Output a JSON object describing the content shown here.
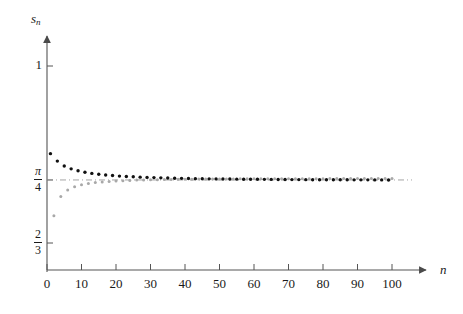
{
  "chart_data": {
    "type": "scatter",
    "title": "",
    "xlabel": "n",
    "ylabel": "s_n",
    "xlim": [
      0,
      110
    ],
    "ylim": [
      0.6,
      1.05
    ],
    "grid": false,
    "legend": "none",
    "x_ticks": [
      0,
      10,
      20,
      30,
      40,
      50,
      60,
      70,
      80,
      90,
      100
    ],
    "x_tick_labels": [
      "0",
      "10",
      "20",
      "30",
      "40",
      "50",
      "60",
      "70",
      "80",
      "90",
      "100"
    ],
    "y_ticks": [
      1,
      0.7853981634,
      0.6666666667
    ],
    "y_tick_labels": [
      "1",
      "π/4",
      "2/3"
    ],
    "y_tick_label_parts": [
      {
        "kind": "plain",
        "text": "1"
      },
      {
        "kind": "fraction",
        "num": "π",
        "num_italic": true,
        "den": "4"
      },
      {
        "kind": "fraction",
        "num": "2",
        "num_italic": false,
        "den": "3"
      }
    ],
    "annotations": [
      {
        "type": "hline",
        "y": 0.7853981634,
        "label": "π/4",
        "style": "dash-dot",
        "color": "#9a9a9a"
      }
    ],
    "series": [
      {
        "name": "odd partial sums",
        "color": "#111111",
        "marker": "filled-circle",
        "marker_size": 3.4,
        "x": [
          1,
          3,
          5,
          7,
          9,
          11,
          13,
          15,
          17,
          19,
          21,
          23,
          25,
          27,
          29,
          31,
          33,
          35,
          37,
          39,
          41,
          43,
          45,
          47,
          49,
          51,
          53,
          55,
          57,
          59,
          61,
          63,
          65,
          67,
          69,
          71,
          73,
          75,
          77,
          79,
          81,
          83,
          85,
          87,
          89,
          91,
          93,
          95,
          97,
          99
        ],
        "y": [
          0.8349,
          0.8209,
          0.8118,
          0.8063,
          0.8026,
          0.7998,
          0.7977,
          0.7961,
          0.7948,
          0.7937,
          0.7927,
          0.792,
          0.7913,
          0.7907,
          0.7902,
          0.7898,
          0.7894,
          0.789,
          0.7887,
          0.7884,
          0.7882,
          0.7879,
          0.7877,
          0.7875,
          0.7874,
          0.7872,
          0.7871,
          0.7869,
          0.7868,
          0.7867,
          0.7866,
          0.7865,
          0.7864,
          0.7863,
          0.7862,
          0.7861,
          0.7861,
          0.786,
          0.7859,
          0.7859,
          0.7858,
          0.7858,
          0.7857,
          0.7857,
          0.7856,
          0.7856,
          0.7856,
          0.7855,
          0.7855,
          0.7854
        ]
      },
      {
        "name": "even partial sums",
        "color": "#a8a8a8",
        "marker": "filled-circle",
        "marker_size": 3.0,
        "x": [
          2,
          4,
          6,
          8,
          10,
          12,
          14,
          16,
          18,
          20,
          22,
          24,
          26,
          28,
          30,
          32,
          34,
          36,
          38,
          40,
          42,
          44,
          46,
          48,
          50,
          52,
          54,
          56,
          58,
          60,
          62,
          64,
          66,
          68,
          70,
          72,
          74,
          76,
          78,
          80,
          82,
          84,
          86,
          88,
          90,
          92,
          94,
          96,
          98,
          100
        ],
        "y": [
          0.7182,
          0.7543,
          0.7664,
          0.7725,
          0.7762,
          0.7787,
          0.7804,
          0.7817,
          0.7827,
          0.7835,
          0.7841,
          0.7846,
          0.7851,
          0.7854,
          0.7857,
          0.786,
          0.7862,
          0.7864,
          0.7866,
          0.7867,
          0.7868,
          0.787,
          0.7871,
          0.7872,
          0.7873,
          0.7873,
          0.7874,
          0.7875,
          0.7875,
          0.7876,
          0.7876,
          0.7877,
          0.7877,
          0.7878,
          0.7878,
          0.7878,
          0.7879,
          0.7879,
          0.7879,
          0.7879,
          0.788,
          0.788,
          0.788,
          0.788,
          0.788,
          0.7881,
          0.7881,
          0.7881,
          0.7881,
          0.7881
        ]
      }
    ]
  },
  "figure": {
    "background_color": "#ffffff",
    "axis_color": "#555555",
    "limit_line_color": "#9a9a9a"
  }
}
